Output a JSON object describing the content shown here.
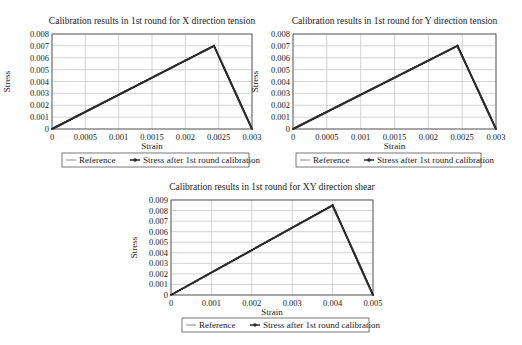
{
  "chart_data": [
    {
      "type": "line",
      "title": "Calibration results in 1st round for X direction tension",
      "xlabel": "Strain",
      "ylabel": "Stress",
      "xlim": [
        0,
        0.003
      ],
      "ylim": [
        0,
        0.008
      ],
      "xticks": [
        "0",
        "0.0005",
        "0.001",
        "0.0015",
        "0.002",
        "0.0025",
        "0.003"
      ],
      "yticks": [
        "0",
        "0.001",
        "0.002",
        "0.003",
        "0.004",
        "0.005",
        "0.006",
        "0.007",
        "0.008"
      ],
      "grid": true,
      "legend_position": "bottom",
      "series": [
        {
          "name": "Reference",
          "x": [
            0,
            0.00243,
            0.003
          ],
          "y": [
            0,
            0.007,
            0
          ]
        },
        {
          "name": "Stress after 1st round calibration",
          "x": [
            0,
            0.00243,
            0.003
          ],
          "y": [
            0,
            0.007,
            0
          ]
        }
      ]
    },
    {
      "type": "line",
      "title": "Calibration results in 1st round for Y direction tension",
      "xlabel": "Strain",
      "ylabel": "Stress",
      "xlim": [
        0,
        0.003
      ],
      "ylim": [
        0,
        0.008
      ],
      "xticks": [
        "0",
        "0.0005",
        "0.001",
        "0.0015",
        "0.002",
        "0.0025",
        "0.003"
      ],
      "yticks": [
        "0",
        "0.001",
        "0.002",
        "0.003",
        "0.004",
        "0.005",
        "0.006",
        "0.007",
        "0.008"
      ],
      "grid": true,
      "legend_position": "bottom",
      "series": [
        {
          "name": "Reference",
          "x": [
            0,
            0.00243,
            0.003
          ],
          "y": [
            0,
            0.007,
            0
          ]
        },
        {
          "name": "Stress after 1st round calibration",
          "x": [
            0,
            0.00243,
            0.003
          ],
          "y": [
            0,
            0.007,
            0
          ]
        }
      ]
    },
    {
      "type": "line",
      "title": "Calibration results in 1st round for XY direction shear",
      "xlabel": "Strain",
      "ylabel": "Stress",
      "xlim": [
        0,
        0.005
      ],
      "ylim": [
        0,
        0.009
      ],
      "xticks": [
        "0",
        "0.001",
        "0.002",
        "0.003",
        "0.004",
        "0.005"
      ],
      "yticks": [
        "0",
        "0.001",
        "0.002",
        "0.003",
        "0.004",
        "0.005",
        "0.006",
        "0.007",
        "0.008",
        "0.009"
      ],
      "grid": true,
      "legend_position": "bottom",
      "series": [
        {
          "name": "Reference",
          "x": [
            0,
            0.004,
            0.005
          ],
          "y": [
            0,
            0.0085,
            0
          ]
        },
        {
          "name": "Stress after 1st round calibration",
          "x": [
            0,
            0.004,
            0.005
          ],
          "y": [
            0,
            0.0085,
            0
          ]
        }
      ]
    }
  ],
  "layout": [
    {
      "left": 52,
      "top": 34,
      "right": 252,
      "bottom": 129,
      "title_y": 24,
      "xlabel_y": 149,
      "ylabel_x": 10,
      "legend": {
        "x": 62,
        "y": 153,
        "w": 187,
        "h": 14
      }
    },
    {
      "left": 293,
      "top": 34,
      "right": 496,
      "bottom": 129,
      "title_y": 24,
      "xlabel_y": 149,
      "ylabel_x": 258,
      "legend": {
        "x": 296,
        "y": 153,
        "w": 185,
        "h": 14
      }
    },
    {
      "left": 171,
      "top": 200,
      "right": 373,
      "bottom": 295,
      "title_y": 190,
      "xlabel_y": 315,
      "ylabel_x": 137,
      "legend": {
        "x": 182,
        "y": 318,
        "w": 187,
        "h": 14
      }
    }
  ],
  "colors": {
    "line": "#2a2a2a",
    "grid": "#c8c8c8",
    "axis": "#555555"
  }
}
